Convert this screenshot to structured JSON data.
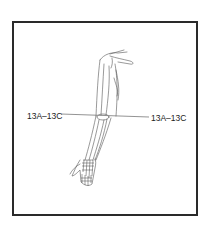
{
  "figure": {
    "section_line": {
      "left_label": "13A–13C",
      "right_label": "13A–13C"
    }
  }
}
